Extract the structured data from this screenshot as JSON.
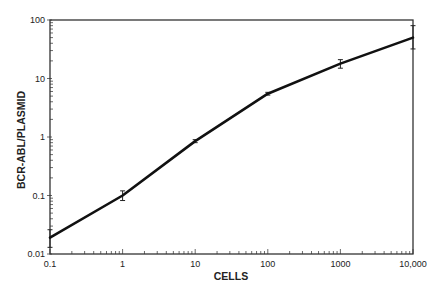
{
  "chart_data": {
    "type": "line",
    "title": "",
    "xlabel": "CELLS",
    "ylabel": "BCR-ABL/PLASMID",
    "xscale": "log",
    "yscale": "log",
    "xlim": [
      0.1,
      10000
    ],
    "ylim": [
      0.01,
      100
    ],
    "grid": false,
    "legend": null,
    "x_ticks": [
      0.1,
      1,
      10,
      100,
      1000,
      10000
    ],
    "x_tick_labels": [
      "0.1",
      "1",
      "10",
      "100",
      "1000",
      "10,000"
    ],
    "y_ticks": [
      0.01,
      0.1,
      1,
      10,
      100
    ],
    "y_tick_labels": [
      "0.01",
      "0.1",
      "1",
      "10",
      "100"
    ],
    "series": [
      {
        "name": "BCR-ABL/PLASMID",
        "x": [
          0.1,
          1,
          10,
          100,
          1000,
          10000
        ],
        "values": [
          0.019,
          0.1,
          0.85,
          5.5,
          18,
          50
        ],
        "error_low": [
          0.013,
          0.082,
          0.8,
          5.2,
          15,
          32
        ],
        "error_high": [
          0.026,
          0.12,
          0.9,
          5.8,
          21,
          80
        ]
      }
    ]
  }
}
